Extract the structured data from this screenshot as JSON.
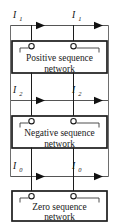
{
  "figure": {
    "background_color": "#ffffff",
    "line_color": "#1c1c1c",
    "rail_color": "#6e6e6e"
  },
  "networks": [
    {
      "id": "positive",
      "line1": "Positive sequence",
      "line2": "network",
      "terminal_left": "o",
      "terminal_right": "o"
    },
    {
      "id": "negative",
      "line1": "Negative sequence",
      "line2": "network",
      "terminal_left": "o",
      "terminal_right": "o"
    },
    {
      "id": "zero",
      "line1": "Zero sequence",
      "line2": "network",
      "terminal_left": "o",
      "terminal_right": "o"
    }
  ],
  "currents": [
    {
      "id": "i1",
      "symbol": "I",
      "subscript": "1",
      "left_label": "I",
      "left_subscript": "1",
      "right_label": "I",
      "right_subscript": "1",
      "direction": "right"
    },
    {
      "id": "i2",
      "symbol": "I",
      "subscript": "2",
      "left_label": "I",
      "left_subscript": "2",
      "right_label": "I",
      "right_subscript": "2",
      "direction": "right"
    },
    {
      "id": "i0",
      "symbol": "I",
      "subscript": "0",
      "left_label": "I",
      "left_subscript": "0",
      "right_label": "I",
      "right_subscript": "0",
      "direction": "right"
    }
  ]
}
